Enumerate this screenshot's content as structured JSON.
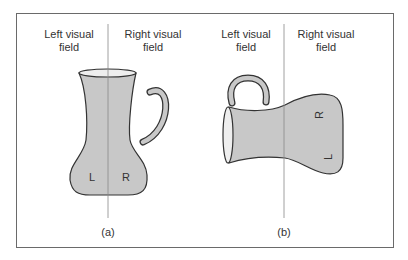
{
  "panels": [
    {
      "id": "a",
      "caption": "(a)",
      "left_field_label": "Left visual field",
      "right_field_label": "Right visual field",
      "left_field_line1": "Left visual",
      "left_field_line2": "field",
      "right_field_line1": "Right visual",
      "right_field_line2": "field",
      "object": "upright jug",
      "letter_left": "L",
      "letter_right": "R"
    },
    {
      "id": "b",
      "caption": "(b)",
      "left_field_line1": "Left visual",
      "left_field_line2": "field",
      "right_field_line1": "Right visual",
      "right_field_line2": "field",
      "object": "rotated jug",
      "letter_top": "R",
      "letter_bottom": "L"
    }
  ],
  "colors": {
    "jug_fill": "#c8c8c8",
    "outline": "#333333",
    "frame": "#6a6a6a",
    "divider": "#888888"
  }
}
